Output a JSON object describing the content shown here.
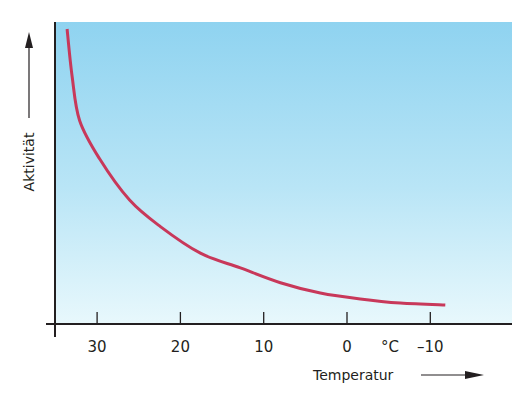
{
  "chart_data": {
    "type": "line",
    "title": "",
    "xlabel": "Temperatur",
    "ylabel": "Aktivität",
    "x_unit": "°C",
    "x_ticks": [
      30,
      20,
      10,
      0,
      -10
    ],
    "x_tick_labels": [
      "30",
      "20",
      "10",
      "0",
      "–10"
    ],
    "x_direction": "decreasing",
    "xlim": [
      35,
      -16
    ],
    "ylim": [
      0,
      100
    ],
    "y_ticks": [],
    "grid": false,
    "legend": null,
    "background": "gradient light blue (top #8fd3f0 to bottom #e6f7fc)",
    "series": [
      {
        "name": "Aktivität",
        "color": "#c8385a",
        "x": [
          33.6,
          33.0,
          32.1,
          29.7,
          26.1,
          22.4,
          17.6,
          12.8,
          8.0,
          3.2,
          -1.6,
          -6.4,
          -11.8
        ],
        "y": [
          100,
          84,
          69,
          56,
          42,
          33,
          24,
          19,
          14,
          10.5,
          8.5,
          7.1,
          6.4
        ]
      }
    ]
  },
  "colors": {
    "curve": "#c8385a",
    "axis": "#231f20",
    "bg_top": "#8fd3f0",
    "bg_bottom": "#e8f8fc"
  },
  "labels": {
    "y_axis_title": "Aktivität",
    "x_axis_title": "Temperatur",
    "unit": "°C"
  }
}
